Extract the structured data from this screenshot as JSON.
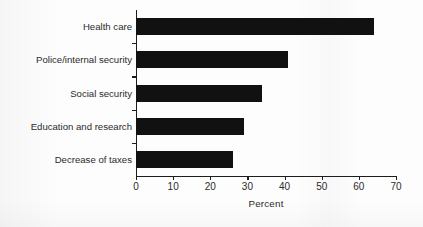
{
  "chart_data": {
    "type": "bar",
    "orientation": "horizontal",
    "title": "",
    "subtitle": "",
    "categories": [
      "Health care",
      "Police/internal security",
      "Social security",
      "Education and research",
      "Decrease of taxes"
    ],
    "values": [
      64,
      41,
      34,
      29,
      26
    ],
    "xlabel": "Percent",
    "ylabel": "",
    "xlim": [
      0,
      70
    ],
    "xticks": [
      0,
      10,
      20,
      30,
      40,
      50,
      60,
      70
    ],
    "xtick_labels": [
      "0",
      "10",
      "20",
      "30",
      "40",
      "50",
      "60",
      "70"
    ],
    "grid": false,
    "legend": null,
    "legend_position": "none",
    "bar_color": "#111111",
    "axis_color": "#1d1d1d",
    "background_color": "#fdfdfd"
  },
  "axis": {
    "x_title": "Percent"
  }
}
